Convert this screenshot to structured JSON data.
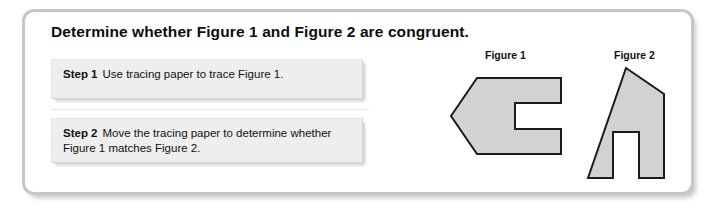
{
  "card": {
    "title": "Determine whether Figure 1 and Figure 2 are congruent.",
    "border_color": "#c6c6c6",
    "background_color": "#ffffff"
  },
  "steps": [
    {
      "label": "Step 1",
      "text": "Use tracing paper to trace Figure 1.",
      "box_color": "#eeeeee"
    },
    {
      "label": "Step 2",
      "text": "Move the tracing paper to determine whether Figure 1 matches Figure 2.",
      "box_color": "#eeeeee"
    }
  ],
  "figures": [
    {
      "caption": "Figure 1",
      "shape_name": "left-pointing-c-arrow",
      "fill_color": "#d2d2d2",
      "stroke_color": "#1b1b1b",
      "points": "4,48 30,10 114,10 114,35 68,35 68,61 114,61 114,86 30,86"
    },
    {
      "caption": "Figure 2",
      "shape_name": "house-with-notch",
      "fill_color": "#d2d2d2",
      "stroke_color": "#1b1b1b",
      "points": "48,4 86,30 86,114 61,114 61,68 35,68 35,114 10,114"
    }
  ]
}
